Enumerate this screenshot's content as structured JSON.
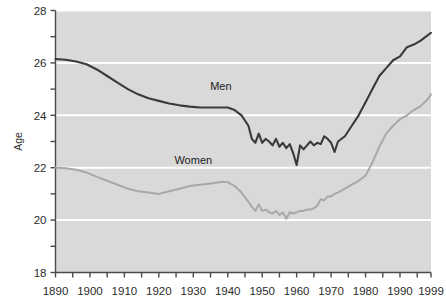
{
  "chart_data": {
    "type": "line",
    "title": "",
    "xlabel": "",
    "ylabel": "Age",
    "xlim": [
      1890,
      1999
    ],
    "ylim": [
      18,
      28
    ],
    "grid": true,
    "grid_axis": "y",
    "legend_position": "inline-annotation",
    "plot_background": "#d9d9d9",
    "gridline_color": "#ffffff",
    "y_ticks_major": [
      18,
      20,
      22,
      24,
      26,
      28
    ],
    "y_ticks_minor": [
      19,
      21,
      23,
      25,
      27
    ],
    "y_tick_labels": [
      "18",
      "20",
      "22",
      "24",
      "26",
      "28"
    ],
    "x_tick_labels": [
      "1890",
      "1900",
      "1910",
      "1920",
      "1930",
      "1940",
      "1950",
      "1960",
      "1970",
      "1980",
      "1990",
      "1999"
    ],
    "x_ticks_major": [
      1890,
      1900,
      1910,
      1920,
      1930,
      1940,
      1950,
      1960,
      1970,
      1980,
      1990,
      1999
    ],
    "x_ticks_minor": [
      1895,
      1905,
      1915,
      1925,
      1935,
      1945,
      1955,
      1965,
      1975,
      1985,
      1995
    ],
    "series": [
      {
        "name": "Men",
        "color": "#3a3a3a",
        "label_text": "Men",
        "label_x": 1938,
        "label_y": 24.95,
        "x": [
          1890,
          1893,
          1896,
          1899,
          1902,
          1905,
          1908,
          1911,
          1914,
          1917,
          1920,
          1923,
          1926,
          1929,
          1932,
          1935,
          1938,
          1940,
          1942,
          1944,
          1946,
          1947,
          1948,
          1949,
          1950,
          1951,
          1952,
          1953,
          1954,
          1955,
          1956,
          1957,
          1958,
          1959,
          1960,
          1961,
          1962,
          1963,
          1964,
          1965,
          1966,
          1967,
          1968,
          1969,
          1970,
          1971,
          1972,
          1974,
          1976,
          1978,
          1980,
          1982,
          1984,
          1986,
          1988,
          1990,
          1992,
          1994,
          1996,
          1998,
          1999
        ],
        "y": [
          26.15,
          26.12,
          26.05,
          25.95,
          25.75,
          25.5,
          25.25,
          25.0,
          24.8,
          24.65,
          24.55,
          24.45,
          24.38,
          24.33,
          24.3,
          24.3,
          24.3,
          24.3,
          24.2,
          24.0,
          23.6,
          23.1,
          22.95,
          23.3,
          22.95,
          23.1,
          23.0,
          22.85,
          23.1,
          22.8,
          22.95,
          22.75,
          22.9,
          22.55,
          22.1,
          22.85,
          22.7,
          22.85,
          23.0,
          22.85,
          22.95,
          22.9,
          23.2,
          23.1,
          22.95,
          22.6,
          23.0,
          23.2,
          23.6,
          24.0,
          24.5,
          25.0,
          25.5,
          25.8,
          26.1,
          26.25,
          26.6,
          26.7,
          26.85,
          27.05,
          27.15
        ]
      },
      {
        "name": "Women",
        "color": "#a8a8a8",
        "label_text": "Women",
        "label_x": 1930,
        "label_y": 22.15,
        "x": [
          1890,
          1893,
          1896,
          1899,
          1902,
          1905,
          1908,
          1911,
          1914,
          1917,
          1920,
          1923,
          1926,
          1929,
          1932,
          1935,
          1938,
          1940,
          1942,
          1944,
          1946,
          1947,
          1948,
          1949,
          1950,
          1951,
          1952,
          1953,
          1954,
          1955,
          1956,
          1957,
          1958,
          1959,
          1960,
          1961,
          1962,
          1963,
          1964,
          1965,
          1966,
          1967,
          1968,
          1969,
          1970,
          1971,
          1972,
          1974,
          1976,
          1978,
          1980,
          1982,
          1984,
          1986,
          1988,
          1990,
          1992,
          1994,
          1996,
          1998,
          1999
        ],
        "y": [
          22.0,
          21.98,
          21.92,
          21.82,
          21.65,
          21.5,
          21.35,
          21.2,
          21.1,
          21.05,
          21.0,
          21.1,
          21.2,
          21.3,
          21.35,
          21.4,
          21.45,
          21.45,
          21.3,
          21.05,
          20.7,
          20.5,
          20.35,
          20.6,
          20.35,
          20.4,
          20.3,
          20.25,
          20.35,
          20.2,
          20.3,
          20.05,
          20.3,
          20.25,
          20.3,
          20.35,
          20.35,
          20.4,
          20.4,
          20.45,
          20.55,
          20.8,
          20.75,
          20.9,
          20.9,
          21.0,
          21.05,
          21.2,
          21.35,
          21.5,
          21.7,
          22.2,
          22.8,
          23.3,
          23.6,
          23.85,
          24.0,
          24.2,
          24.35,
          24.6,
          24.8
        ]
      }
    ]
  }
}
